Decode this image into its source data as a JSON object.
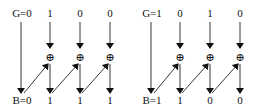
{
  "diagrams": [
    {
      "name": "example-1",
      "gray_label": "G=0",
      "gray_bits": [
        "1",
        "0",
        "0"
      ],
      "binary_label": "B=0",
      "binary_bits": [
        "1",
        "1",
        "1"
      ]
    },
    {
      "name": "example-2",
      "gray_label": "G=1",
      "gray_bits": [
        "0",
        "1",
        "0"
      ],
      "binary_label": "B=1",
      "binary_bits": [
        "1",
        "0",
        "0"
      ]
    }
  ],
  "operator_symbol": "⊕",
  "icons": {
    "xor": "xor-circle-plus-icon",
    "arrow": "arrow-down-icon"
  }
}
